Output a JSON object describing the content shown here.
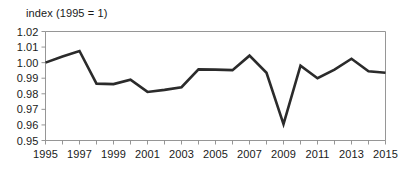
{
  "chart_data": {
    "type": "line",
    "title": "index (1995 = 1)",
    "xlabel": "",
    "ylabel": "",
    "ylim": [
      0.95,
      1.02
    ],
    "xlim": [
      1995,
      2015
    ],
    "ytick_step": 0.01,
    "grid": false,
    "legend": "none",
    "line_color": "#2b2b2b",
    "frame_color": "#8a8a8a",
    "x": [
      1995,
      1996,
      1997,
      1998,
      1999,
      2000,
      2001,
      2002,
      2003,
      2004,
      2005,
      2006,
      2007,
      2008,
      2009,
      2010,
      2011,
      2012,
      2013,
      2014,
      2015
    ],
    "values": [
      1.0,
      1.004,
      1.0075,
      0.9865,
      0.9862,
      0.989,
      0.9812,
      0.9825,
      0.9842,
      0.9957,
      0.9955,
      0.9952,
      1.0045,
      0.9935,
      0.9605,
      0.998,
      0.99,
      0.9955,
      1.0025,
      0.9945,
      0.9935
    ],
    "ytick_labels": [
      "1.02",
      "1.01",
      "1.00",
      "0.99",
      "0.98",
      "0.97",
      "0.96",
      "0.95"
    ],
    "ytick_values": [
      1.02,
      1.01,
      1.0,
      0.99,
      0.98,
      0.97,
      0.96,
      0.95
    ],
    "xtick_labels": [
      "1995",
      "1997",
      "1999",
      "2001",
      "2003",
      "2005",
      "2007",
      "2009",
      "2011",
      "2013",
      "2015"
    ],
    "xtick_values": [
      1995,
      1997,
      1999,
      2001,
      2003,
      2005,
      2007,
      2009,
      2011,
      2013,
      2015
    ],
    "xtick_minor_values": [
      1996,
      1998,
      2000,
      2002,
      2004,
      2006,
      2008,
      2010,
      2012,
      2014
    ]
  }
}
